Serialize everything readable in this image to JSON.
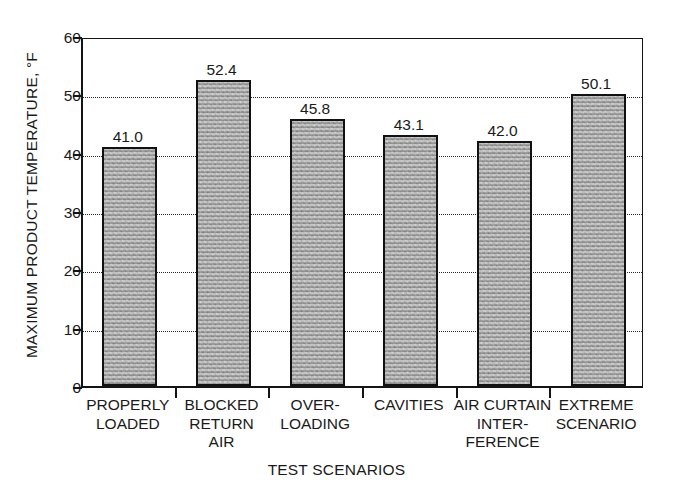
{
  "chart_data": {
    "type": "bar",
    "title": "",
    "xlabel": "TEST SCENARIOS",
    "ylabel": "MAXIMUM PRODUCT TEMPERATURE, °F",
    "categories": [
      "PROPERLY\nLOADED",
      "BLOCKED\nRETURN\nAIR",
      "OVER-\nLOADING",
      "CAVITIES",
      "AIR CURTAIN\nINTER-\nFERENCE",
      "EXTREME\nSCENARIO"
    ],
    "values": [
      41.0,
      52.4,
      45.8,
      43.1,
      42.0,
      50.1
    ],
    "value_labels": [
      "41.0",
      "52.4",
      "45.8",
      "43.1",
      "42.0",
      "50.1"
    ],
    "ylim": [
      0,
      60
    ],
    "yticks": [
      0,
      10,
      20,
      30,
      40,
      50,
      60
    ],
    "ytick_labels": [
      "0",
      "10",
      "20",
      "30",
      "40",
      "50",
      "60"
    ],
    "grid": "horizontal-dotted",
    "legend": "none",
    "bar_fill": "#b0b0b0",
    "bar_edge": "#111111",
    "axis_color": "#141414",
    "background": "#ffffff"
  }
}
